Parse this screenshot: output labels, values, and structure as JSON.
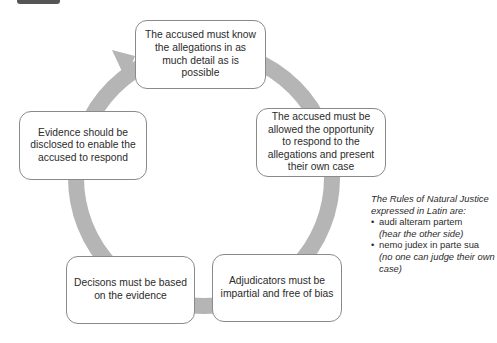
{
  "diagram": {
    "type": "cycle",
    "colors": {
      "ring": "#b5b5b5",
      "box_border": "#8a8a8a",
      "tab": "#555555"
    },
    "boxes": [
      {
        "id": "top",
        "text": "The accused must know the allegations in as much detail as is possible"
      },
      {
        "id": "right",
        "text": "The accused must be allowed the opportunity to respond to the allegations and present their own case"
      },
      {
        "id": "bottom_right",
        "text": "Adjudicators must be impartial and free of bias"
      },
      {
        "id": "bottom_left",
        "text": "Decisons must be based on the evidence"
      },
      {
        "id": "left",
        "text": "Evidence should be disclosed to enable the accused to respond"
      }
    ],
    "note": {
      "intro": "The Rules of Natural Justice expressed in Latin are:",
      "items": [
        {
          "bullet": "•",
          "latin": "audi alteram partem",
          "translation": "(hear the other side)"
        },
        {
          "bullet": "•",
          "latin": "nemo judex in parte sua",
          "translation": "(no one can judge their own case)"
        }
      ]
    }
  }
}
